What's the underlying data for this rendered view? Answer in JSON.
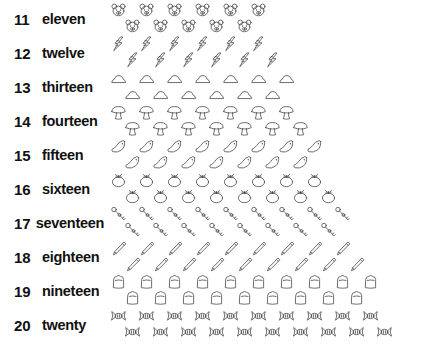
{
  "chart": {
    "title": "",
    "type": "counting-chart",
    "rows": [
      {
        "numeral": "11",
        "word": "eleven",
        "count": 11,
        "icon": "bear-face-icon",
        "top_count": 6,
        "bottom_count": 5
      },
      {
        "numeral": "12",
        "word": "twelve",
        "count": 12,
        "icon": "lightning-bolt-icon",
        "top_count": 6,
        "bottom_count": 6
      },
      {
        "numeral": "13",
        "word": "thirteen",
        "count": 13,
        "icon": "cloud-icon",
        "top_count": 7,
        "bottom_count": 6
      },
      {
        "numeral": "14",
        "word": "fourteen",
        "count": 14,
        "icon": "mushroom-icon",
        "top_count": 7,
        "bottom_count": 7
      },
      {
        "numeral": "15",
        "word": "fifteen",
        "count": 15,
        "icon": "bird-icon",
        "top_count": 8,
        "bottom_count": 7
      },
      {
        "numeral": "16",
        "word": "sixteen",
        "count": 16,
        "icon": "tomato-icon",
        "top_count": 8,
        "bottom_count": 8
      },
      {
        "numeral": "17",
        "word": "seventeen",
        "count": 17,
        "icon": "key-icon",
        "top_count": 9,
        "bottom_count": 8
      },
      {
        "numeral": "18",
        "word": "eighteen",
        "count": 18,
        "icon": "pencil-icon",
        "top_count": 9,
        "bottom_count": 9
      },
      {
        "numeral": "19",
        "word": "nineteen",
        "count": 19,
        "icon": "bread-slice-icon",
        "top_count": 10,
        "bottom_count": 9
      },
      {
        "numeral": "20",
        "word": "twenty",
        "count": 20,
        "icon": "candy-icon",
        "top_count": 10,
        "bottom_count": 10
      }
    ],
    "colors": {
      "text": "#111111",
      "icon_stroke": "#4a4a4a",
      "background": "#ffffff"
    }
  }
}
